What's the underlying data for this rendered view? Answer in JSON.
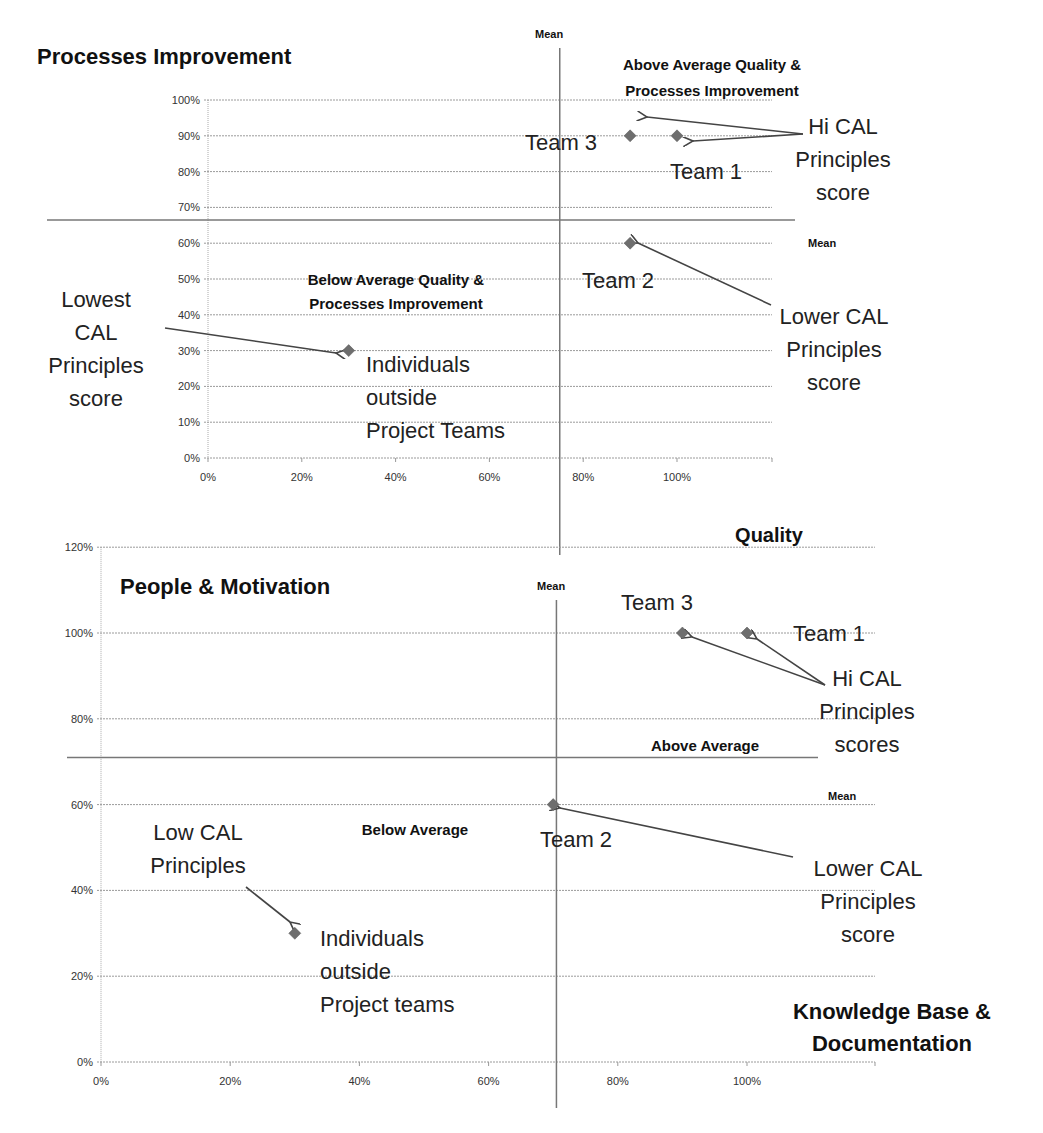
{
  "chart_data": [
    {
      "type": "scatter",
      "title": "Processes Improvement",
      "xlabel": "Quality",
      "ylabel": "Processes Improvement",
      "xlim": [
        0,
        1.2
      ],
      "ylim": [
        0,
        1.0
      ],
      "x_ticks": [
        "0%",
        "20%",
        "40%",
        "60%",
        "80%",
        "100%"
      ],
      "y_ticks": [
        "0%",
        "10%",
        "20%",
        "30%",
        "40%",
        "50%",
        "60%",
        "70%",
        "80%",
        "90%",
        "100%"
      ],
      "grid": true,
      "mean_x": 0.75,
      "mean_y": 0.665,
      "mean_x_label": "Mean",
      "mean_y_label": "Mean",
      "quadrant_labels": {
        "above": [
          "Above Average Quality &",
          "Processes Improvement"
        ],
        "below": [
          "Below Average Quality &",
          "Processes Improvement"
        ]
      },
      "points": [
        {
          "name": "Team 3",
          "x": 0.9,
          "y": 0.9
        },
        {
          "name": "Team 1",
          "x": 1.0,
          "y": 0.9
        },
        {
          "name": "Team 2",
          "x": 0.9,
          "y": 0.6
        },
        {
          "name": "Individuals outside Project Teams",
          "x": 0.3,
          "y": 0.3
        }
      ],
      "annotations": {
        "point_labels": [
          "Team 3",
          "Team 1",
          "Team 2"
        ],
        "individuals": [
          "Individuals",
          "outside",
          "Project Teams"
        ],
        "hi": [
          "Hi CAL",
          "Principles",
          "score"
        ],
        "lower": [
          "Lower CAL",
          "Principles",
          "score"
        ],
        "lowest": [
          "Lowest",
          "CAL",
          "Principles",
          "score"
        ]
      }
    },
    {
      "type": "scatter",
      "title": "People & Motivation",
      "xlabel": "Knowledge Base & Documentation",
      "ylabel": "People & Motivation",
      "xlim": [
        0,
        1.2
      ],
      "ylim": [
        0,
        1.2
      ],
      "x_ticks": [
        "0%",
        "20%",
        "40%",
        "60%",
        "80%",
        "100%"
      ],
      "y_ticks": [
        "0%",
        "20%",
        "40%",
        "60%",
        "80%",
        "100%",
        "120%"
      ],
      "grid": true,
      "mean_x": 0.705,
      "mean_y": 0.71,
      "mean_x_label": "Mean",
      "mean_y_label": "Mean",
      "quadrant_labels": {
        "above": [
          "Above Average"
        ],
        "below": [
          "Below Average"
        ]
      },
      "points": [
        {
          "name": "Team 3",
          "x": 0.9,
          "y": 1.0
        },
        {
          "name": "Team 1",
          "x": 1.0,
          "y": 1.0
        },
        {
          "name": "Team 2",
          "x": 0.7,
          "y": 0.6
        },
        {
          "name": "Individuals outside Project teams",
          "x": 0.3,
          "y": 0.3
        }
      ],
      "annotations": {
        "point_labels": [
          "Team 3",
          "Team 1",
          "Team 2"
        ],
        "individuals": [
          "Individuals",
          "outside",
          "Project teams"
        ],
        "hi": [
          "Hi CAL",
          "Principles",
          "scores"
        ],
        "lower": [
          "Lower CAL",
          "Principles",
          "score"
        ],
        "low": [
          "Low CAL",
          "Principles"
        ],
        "xlabel_lines": [
          "Knowledge Base &",
          "Documentation"
        ]
      }
    }
  ]
}
